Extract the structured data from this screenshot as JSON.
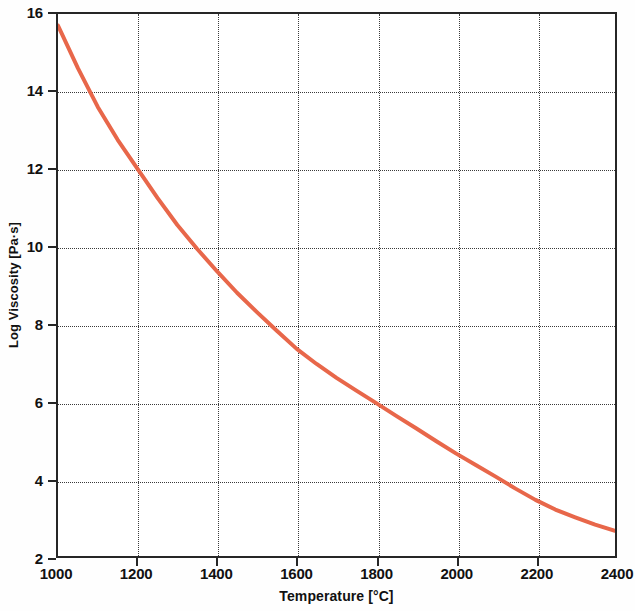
{
  "chart_data": {
    "type": "line",
    "title": "",
    "xlabel": "Temperature [°C]",
    "ylabel": "Log Viscosity [Pa·s]",
    "xlim": [
      1000,
      2400
    ],
    "ylim": [
      2,
      16
    ],
    "xticks": [
      1000,
      1200,
      1400,
      1600,
      1800,
      2000,
      2200,
      2400
    ],
    "yticks": [
      2,
      4,
      6,
      8,
      10,
      12,
      14,
      16
    ],
    "xtick_labels": [
      "1000",
      "1200",
      "1400",
      "1600",
      "1800",
      "2000",
      "2200",
      "2400"
    ],
    "ytick_labels": [
      "2",
      "4",
      "6",
      "8",
      "10",
      "12",
      "14",
      "16"
    ],
    "grid": true,
    "grid_style": "dotted",
    "legend": false,
    "series": [
      {
        "name": "Log viscosity vs temperature",
        "color": "#E8674A",
        "line_width": 4,
        "x": [
          1000,
          1050,
          1100,
          1150,
          1200,
          1250,
          1300,
          1350,
          1400,
          1450,
          1500,
          1550,
          1600,
          1650,
          1700,
          1750,
          1800,
          1850,
          1900,
          1950,
          2000,
          2050,
          2100,
          2150,
          2200,
          2250,
          2300,
          2350,
          2400
        ],
        "values": [
          15.7,
          14.6,
          13.6,
          12.75,
          12.0,
          11.25,
          10.55,
          9.93,
          9.35,
          8.8,
          8.3,
          7.82,
          7.35,
          6.96,
          6.6,
          6.27,
          5.95,
          5.62,
          5.3,
          4.97,
          4.65,
          4.35,
          4.05,
          3.74,
          3.45,
          3.2,
          3.0,
          2.81,
          2.65
        ]
      }
    ]
  },
  "axes": {
    "frame_color": "#262626",
    "grid_color": "#3a3a3a",
    "background": "#ffffff"
  }
}
